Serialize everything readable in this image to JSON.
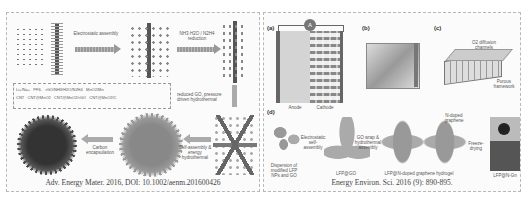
{
  "left_panel": {
    "caption": "Adv. Energy Mater. 2016, DOI: 10.1002/aenm.201600426",
    "steps": [
      {
        "label": "Electrostatic assembly"
      },
      {
        "label": "NH3·H2O / N2H4 reduction"
      },
      {
        "label": "reduced GO, pressure driven hydrothermal"
      },
      {
        "label": "Carbon encapsulation"
      },
      {
        "label": "Self-assembly & energy hydrothermal"
      }
    ],
    "legend": {
      "row1": [
        "Li+/Na+",
        "PF6-",
        "rGO/NH3/H2O/N2H4",
        "MnO2/Mn"
      ],
      "row2": [
        "CNT",
        "CNT@MnO2",
        "CNT@MnO2/rGO",
        "CNT@MnO2/C"
      ]
    }
  },
  "right_panel": {
    "caption": "Energy Environ. Sci. 2016 (9): 890-895.",
    "subfigures": {
      "a": {
        "label": "(a)",
        "anode": "Anode",
        "cathode": "Cathode",
        "meter": "A",
        "minus": "-",
        "plus": "+"
      },
      "b": {
        "label": "(b)"
      },
      "c": {
        "label": "(c)",
        "notes": [
          "O2 diffusion channels",
          "Li2O2",
          "Porous framework"
        ]
      },
      "d": {
        "label": "(d)",
        "stages": [
          "Dispersion of modified LFP NPs and GO",
          "LFP@GO",
          "LFP@N-doped graphene hydrogel",
          "LFP@N-Gn"
        ],
        "arrows": [
          "Electrostatic self-assembly",
          "GO wrap & hydrothermal assembly",
          "Freeze-drying"
        ],
        "tag": "N-doped graphene"
      }
    }
  }
}
